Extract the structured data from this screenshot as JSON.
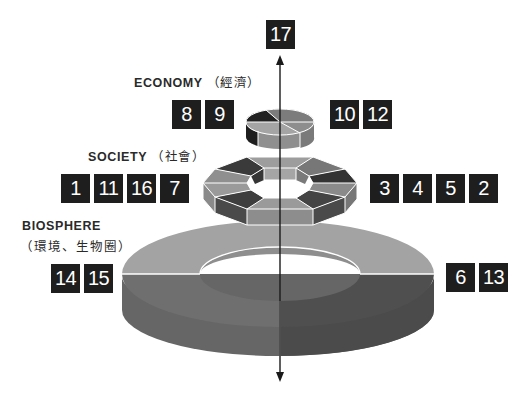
{
  "diagram": {
    "type": "layered-ring-stack",
    "axis": {
      "direction": "vertical",
      "arrows": [
        "up",
        "down"
      ],
      "top_badge": "17"
    },
    "layers": [
      {
        "id": "economy",
        "label_en": "ECONOMY",
        "label_zh": "（經濟）",
        "shape": "disc",
        "left_badges": [
          "8",
          "9"
        ],
        "right_badges": [
          "10",
          "12"
        ]
      },
      {
        "id": "society",
        "label_en": "SOCIETY",
        "label_zh": "（社會）",
        "shape": "octagonal-ring",
        "left_badges": [
          "1",
          "11",
          "16",
          "7"
        ],
        "right_badges": [
          "3",
          "4",
          "5",
          "2"
        ]
      },
      {
        "id": "biosphere",
        "label_en": "BIOSPHERE",
        "label_zh": "（環境、生物圈）",
        "shape": "ring",
        "left_badges": [
          "14",
          "15"
        ],
        "right_badges": [
          "6",
          "13"
        ]
      }
    ],
    "colors": {
      "badge_bg": "#1e1e1e",
      "badge_text": "#ffffff",
      "light_gray": "#a6a6a6",
      "mid_gray": "#7b7b7b",
      "dark_gray": "#4a4a4a",
      "darkest": "#262626",
      "separator": "#ffffff",
      "axis": "#1a1a1a"
    }
  }
}
